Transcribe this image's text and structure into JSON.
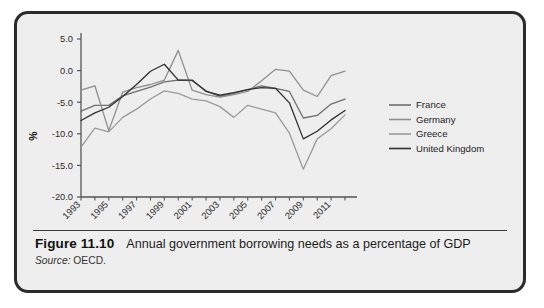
{
  "figure": {
    "number": "Figure 11.10",
    "caption": "Annual government borrowing needs as a percentage of GDP",
    "source_label": "Source:",
    "source_value": " OECD."
  },
  "colors": {
    "card_background": "#eeeeee",
    "card_border": "#2b2b2b",
    "axis": "#555555",
    "france": "#6e6e6e",
    "germany": "#8f8f8f",
    "greece": "#9a9a9a",
    "united_kingdom": "#2f2f2f"
  },
  "chart_data": {
    "type": "line",
    "title": "",
    "xlabel": "",
    "ylabel": "%",
    "ylim": [
      -20.0,
      5.0
    ],
    "ytick_labels": [
      "5.0",
      "0.0",
      "-5.0",
      "-10.0",
      "-15.0",
      "-20.0"
    ],
    "ytick_values": [
      5.0,
      0.0,
      -5.0,
      -10.0,
      -15.0,
      -20.0
    ],
    "grid": false,
    "legend_position": "right",
    "x": [
      1993,
      1994,
      1995,
      1996,
      1997,
      1998,
      1999,
      2000,
      2001,
      2002,
      2003,
      2004,
      2005,
      2006,
      2007,
      2008,
      2009,
      2010,
      2011,
      2012
    ],
    "xtick_labels": [
      "1993",
      "1995",
      "1997",
      "1999",
      "2001",
      "2003",
      "2005",
      "2007",
      "2009",
      "2011"
    ],
    "xtick_values": [
      1993,
      1995,
      1997,
      1999,
      2001,
      2003,
      2005,
      2007,
      2009,
      2011
    ],
    "series": [
      {
        "name": "France",
        "color": "#6e6e6e",
        "values": [
          -6.4,
          -5.5,
          -5.5,
          -4.0,
          -3.3,
          -2.6,
          -1.8,
          -1.5,
          -1.6,
          -3.2,
          -4.1,
          -3.6,
          -3.0,
          -2.4,
          -2.8,
          -3.3,
          -7.5,
          -7.1,
          -5.3,
          -4.5
        ]
      },
      {
        "name": "Germany",
        "color": "#8f8f8f",
        "values": [
          -3.1,
          -2.4,
          -9.5,
          -3.4,
          -2.7,
          -2.2,
          -1.5,
          3.2,
          -3.1,
          -3.8,
          -4.2,
          -3.8,
          -3.3,
          -1.6,
          0.2,
          -0.1,
          -3.1,
          -4.1,
          -0.8,
          -0.1
        ]
      },
      {
        "name": "Greece",
        "color": "#9a9a9a",
        "values": [
          -12.1,
          -9.1,
          -9.7,
          -7.4,
          -6.1,
          -4.5,
          -3.2,
          -3.6,
          -4.5,
          -4.8,
          -5.7,
          -7.4,
          -5.5,
          -6.1,
          -6.7,
          -9.9,
          -15.6,
          -10.8,
          -9.2,
          -7.0
        ]
      },
      {
        "name": "United Kingdom",
        "color": "#2f2f2f",
        "values": [
          -7.9,
          -6.7,
          -5.8,
          -4.1,
          -2.2,
          -0.1,
          1.0,
          -1.5,
          -1.5,
          -3.3,
          -3.9,
          -3.5,
          -3.0,
          -2.7,
          -2.8,
          -5.1,
          -10.8,
          -9.6,
          -7.8,
          -6.3
        ]
      }
    ],
    "legend": [
      "France",
      "Germany",
      "Greece",
      "United Kingdom"
    ]
  }
}
